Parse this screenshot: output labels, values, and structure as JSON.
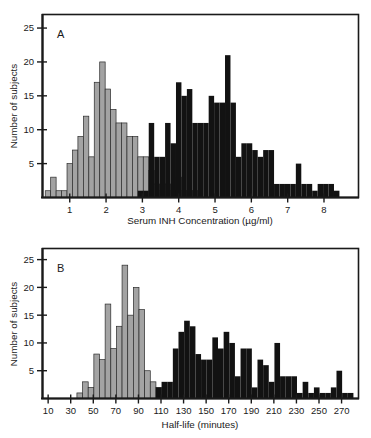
{
  "figure": {
    "background_color": "#ffffff",
    "ink_color": "#1a1a1a",
    "slow_color": "#a3a3a3",
    "fast_color": "#121212"
  },
  "panels": [
    {
      "id": "A",
      "letter": "A",
      "ylabel": "Number of subjects",
      "xlabel": "Serum INH Concentration (µg/ml)",
      "yticks": [
        5,
        10,
        15,
        20,
        25
      ],
      "xticks": [
        1,
        2,
        3,
        4,
        5,
        6,
        7,
        8
      ]
    },
    {
      "id": "B",
      "letter": "B",
      "ylabel": "Number of subjects",
      "xlabel": "Half-life (minutes)",
      "yticks": [
        5,
        10,
        15,
        20,
        25
      ],
      "xticks": [
        10,
        30,
        50,
        70,
        90,
        110,
        130,
        150,
        170,
        190,
        210,
        230,
        250,
        270
      ]
    }
  ],
  "chart_data": [
    {
      "type": "bar",
      "panel": "A",
      "title": "Serum INH concentration distribution",
      "xlabel": "Serum INH Concentration (µg/ml)",
      "ylabel": "Number of subjects",
      "xlim": [
        0.25,
        8.95
      ],
      "ylim": [
        0,
        27
      ],
      "bin_width": 0.15,
      "grid": false,
      "legend": false,
      "series": [
        {
          "name": "slow acetylators",
          "color": "#a3a3a3",
          "x": [
            0.4,
            0.55,
            0.7,
            0.85,
            1.0,
            1.15,
            1.3,
            1.45,
            1.6,
            1.75,
            1.9,
            2.05,
            2.2,
            2.35,
            2.5,
            2.65,
            2.8,
            2.95,
            3.1,
            3.25,
            3.4,
            3.55,
            3.7,
            3.85,
            4.0,
            4.15,
            4.3,
            4.45
          ],
          "values": [
            1,
            3,
            1,
            1,
            5,
            7,
            9,
            12,
            6,
            17,
            20,
            16,
            13,
            11,
            11,
            9,
            9,
            6,
            6,
            4,
            2,
            1,
            2,
            1,
            3,
            1,
            1,
            1
          ]
        },
        {
          "name": "fast acetylators",
          "color": "#121212",
          "x": [
            2.95,
            3.1,
            3.25,
            3.4,
            3.55,
            3.7,
            3.85,
            4.0,
            4.15,
            4.3,
            4.45,
            4.6,
            4.75,
            4.9,
            5.05,
            5.2,
            5.35,
            5.5,
            5.65,
            5.8,
            5.95,
            6.1,
            6.25,
            6.4,
            6.55,
            6.7,
            6.85,
            7.0,
            7.15,
            7.3,
            7.45,
            7.6,
            7.75,
            7.9,
            8.05,
            8.2,
            8.35
          ],
          "values": [
            1,
            1,
            11,
            6,
            6,
            11,
            8,
            17,
            15,
            16,
            11,
            11,
            11,
            15,
            14,
            14,
            21,
            14,
            6,
            8,
            8,
            7,
            6,
            7,
            7,
            2,
            2,
            2,
            2,
            5,
            2,
            2,
            1,
            2,
            2,
            2,
            1
          ]
        }
      ]
    },
    {
      "type": "bar",
      "panel": "B",
      "title": "Isoniazid half-life distribution",
      "xlabel": "Half-life (minutes)",
      "ylabel": "Number of subjects",
      "xlim": [
        5,
        285
      ],
      "ylim": [
        0,
        27
      ],
      "bin_width": 5,
      "grid": false,
      "legend": false,
      "series": [
        {
          "name": "fast acetylators",
          "color": "#a3a3a3",
          "x": [
            38,
            43,
            48,
            53,
            58,
            63,
            68,
            73,
            78,
            83,
            88,
            93,
            98,
            103,
            108
          ],
          "values": [
            1,
            3,
            2,
            8,
            7,
            17,
            9,
            13,
            24,
            15,
            20,
            16,
            5,
            3,
            2
          ]
        },
        {
          "name": "slow acetylators",
          "color": "#121212",
          "x": [
            108,
            113,
            118,
            123,
            128,
            133,
            138,
            143,
            148,
            153,
            158,
            163,
            168,
            173,
            178,
            183,
            188,
            193,
            198,
            203,
            208,
            213,
            218,
            223,
            228,
            233,
            238,
            243,
            248,
            253,
            258,
            263,
            268,
            273,
            278
          ],
          "values": [
            2,
            3,
            3,
            9,
            12,
            14,
            13,
            8,
            7,
            7,
            11,
            9,
            12,
            10,
            4,
            9,
            9,
            2,
            7,
            6,
            3,
            10,
            4,
            4,
            4,
            1,
            3,
            1,
            2,
            1,
            1,
            2,
            5,
            1,
            1
          ]
        }
      ]
    }
  ]
}
